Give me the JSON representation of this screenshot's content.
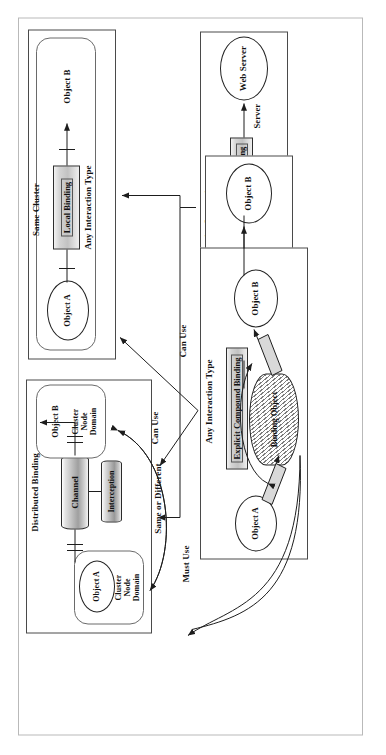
{
  "diagram": {
    "outer_frame": "outer-frame",
    "panels": {
      "same_cluster": {
        "header": "Same Cluster",
        "binding_label": "Local Binding",
        "interaction_label": "Any Interaction Type",
        "object_a": "Object A",
        "object_b": "Object B"
      },
      "distributed": {
        "header": "Distributed Binding",
        "channel_label": "Channel",
        "interception_label": "Interception",
        "relation_label": "Same or Different",
        "object_a": "Object A",
        "object_b": "Object B",
        "domain_a": "Cluster\nNode\nDomain",
        "domain_b": "Cluster\nNode\nDomain"
      },
      "implicit": {
        "header": "Operation Interaction\nClient/Server Causality\nServer Available",
        "binding_label": "Implicit Binding",
        "role_left": "Client",
        "role_right": "Server",
        "object_a": "Client\nWeb Browser",
        "object_b": "Web Server"
      },
      "primitive": {
        "header": "Any Interaction Type",
        "binding_label": "Explicit  Primitive Binding",
        "object_a": "Object A",
        "object_b": "Object B"
      },
      "compound": {
        "header": "Any Interaction Type",
        "binding_label": "Explicit Compound Binding",
        "binding_object": "Binding Object",
        "object_a": "Object A",
        "object_b": "Object B"
      }
    },
    "connectors": {
      "can_use_implicit": "Can Use",
      "can_use_primitive": "Can Use",
      "must_use_compound": "Must Use"
    },
    "colors": {
      "ink": "#111111",
      "frame": "#b9b9b9",
      "panel_border": "#4a4a4a",
      "bar_fill": "#c8c8c8",
      "channel_fill": "#bdbdbd"
    }
  }
}
